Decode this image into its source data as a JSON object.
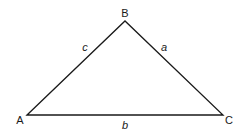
{
  "diagram": {
    "type": "triangle",
    "vertices": [
      {
        "id": "A",
        "label": "A",
        "x": 27,
        "y": 115
      },
      {
        "id": "B",
        "label": "B",
        "x": 125,
        "y": 21
      },
      {
        "id": "C",
        "label": "C",
        "x": 223,
        "y": 115
      }
    ],
    "sides": [
      {
        "id": "a",
        "label": "a",
        "from": "B",
        "to": "C"
      },
      {
        "id": "b",
        "label": "b",
        "from": "A",
        "to": "C"
      },
      {
        "id": "c",
        "label": "c",
        "from": "A",
        "to": "B"
      }
    ],
    "stroke_color": "#1a1a1a"
  }
}
